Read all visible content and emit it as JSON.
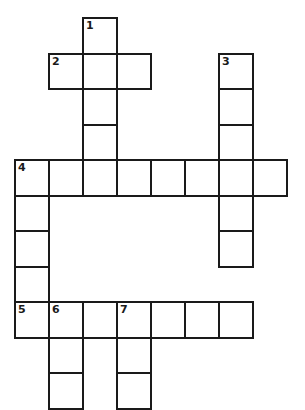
{
  "puzzle": {
    "type": "crossword",
    "cell_size": {
      "w": 34,
      "h": 35.5
    },
    "origin": {
      "x": 15,
      "y": 18
    },
    "cells": [
      {
        "r": 0,
        "c": 2,
        "num": "1"
      },
      {
        "r": 1,
        "c": 1,
        "num": "2"
      },
      {
        "r": 1,
        "c": 2
      },
      {
        "r": 1,
        "c": 3
      },
      {
        "r": 1,
        "c": 6,
        "num": "3"
      },
      {
        "r": 2,
        "c": 2
      },
      {
        "r": 2,
        "c": 6
      },
      {
        "r": 3,
        "c": 2
      },
      {
        "r": 3,
        "c": 6
      },
      {
        "r": 4,
        "c": 0,
        "num": "4"
      },
      {
        "r": 4,
        "c": 1
      },
      {
        "r": 4,
        "c": 2
      },
      {
        "r": 4,
        "c": 3
      },
      {
        "r": 4,
        "c": 4
      },
      {
        "r": 4,
        "c": 5
      },
      {
        "r": 4,
        "c": 6
      },
      {
        "r": 4,
        "c": 7
      },
      {
        "r": 5,
        "c": 0
      },
      {
        "r": 5,
        "c": 6
      },
      {
        "r": 6,
        "c": 0
      },
      {
        "r": 6,
        "c": 6
      },
      {
        "r": 7,
        "c": 0
      },
      {
        "r": 8,
        "c": 0,
        "num": "5"
      },
      {
        "r": 8,
        "c": 1,
        "num": "6"
      },
      {
        "r": 8,
        "c": 2
      },
      {
        "r": 8,
        "c": 3,
        "num": "7"
      },
      {
        "r": 8,
        "c": 4
      },
      {
        "r": 8,
        "c": 5
      },
      {
        "r": 8,
        "c": 6
      },
      {
        "r": 9,
        "c": 1
      },
      {
        "r": 9,
        "c": 3
      },
      {
        "r": 10,
        "c": 1
      },
      {
        "r": 10,
        "c": 3
      }
    ],
    "clue_numbers": [
      "1",
      "2",
      "3",
      "4",
      "5",
      "6",
      "7"
    ]
  }
}
